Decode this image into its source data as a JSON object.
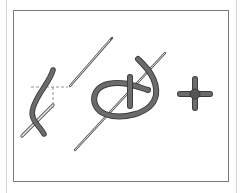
{
  "figure": {
    "title": "",
    "steps": [
      {
        "id": 1,
        "content": "needle brought up through fabric beside thread, dashed guide lines to needle position"
      },
      {
        "id": 2,
        "content": "thread looped around needle"
      },
      {
        "id": 3,
        "content": "finished knot (cross-shaped)"
      }
    ],
    "colors": {
      "thread": "#6b6b6b",
      "thread_outline": "#3a3a3a",
      "needle": "#9a9a9a",
      "frame": "#7a7a7a",
      "outer_line": "#d4d4d4",
      "background": "#ffffff"
    }
  }
}
